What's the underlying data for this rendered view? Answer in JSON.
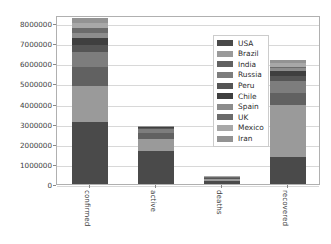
{
  "chart_data": {
    "type": "bar",
    "subtype": "stacked-bar",
    "title": "",
    "xlabel": "",
    "ylabel": "",
    "categories": [
      "confirmed",
      "active",
      "deaths",
      "recovered"
    ],
    "ylim": [
      0,
      8400000
    ],
    "yticks": [
      0,
      1000000,
      2000000,
      3000000,
      4000000,
      5000000,
      6000000,
      7000000,
      8000000
    ],
    "ytick_labels": [
      "0",
      "1000000",
      "2000000",
      "3000000",
      "4000000",
      "5000000",
      "6000000",
      "7000000",
      "8000000"
    ],
    "grid": true,
    "grid_axis": "y",
    "legend": {
      "position": "upper right",
      "inside_axes": true,
      "entries": [
        "USA",
        "Brazil",
        "India",
        "Russia",
        "Peru",
        "Chile",
        "Spain",
        "UK",
        "Mexico",
        "Iran"
      ]
    },
    "series": [
      {
        "name": "USA",
        "color": "#4a4a4a",
        "values": [
          3100000,
          1650000,
          133000,
          1350000
        ]
      },
      {
        "name": "Brazil",
        "color": "#9a9a9a",
        "values": [
          1750000,
          570000,
          97000,
          2580000
        ]
      },
      {
        "name": "India",
        "color": "#616161",
        "values": [
          950000,
          330000,
          24000,
          600000
        ]
      },
      {
        "name": "Russia",
        "color": "#7d7d7d",
        "values": [
          780000,
          175000,
          13000,
          590000
        ]
      },
      {
        "name": "Peru",
        "color": "#555555",
        "values": [
          350000,
          75000,
          13000,
          240000
        ]
      },
      {
        "name": "Chile",
        "color": "#3f3f3f",
        "values": [
          310000,
          16000,
          8000,
          280000
        ]
      },
      {
        "name": "Spain",
        "color": "#8c8c8c",
        "values": [
          280000,
          20000,
          28000,
          150000
        ]
      },
      {
        "name": "UK",
        "color": "#6b6b6b",
        "values": [
          260000,
          14000,
          41000,
          14000
        ]
      },
      {
        "name": "Mexico",
        "color": "#a8a8a8",
        "values": [
          230000,
          12000,
          28000,
          190000
        ]
      },
      {
        "name": "Iran",
        "color": "#939393",
        "values": [
          220000,
          16000,
          13000,
          190000
        ]
      }
    ],
    "totals": [
      8230000,
      2878000,
      398000,
      6184000
    ],
    "bar_width_ratio": 0.55
  },
  "axis": {
    "y_tick_labels": [
      "8000000",
      "7000000",
      "6000000",
      "5000000",
      "4000000",
      "3000000",
      "2000000",
      "1000000",
      "0"
    ],
    "x_tick_labels": [
      "confirmed",
      "active",
      "deaths",
      "recovered"
    ]
  },
  "legend_labels": [
    "USA",
    "Brazil",
    "India",
    "Russia",
    "Peru",
    "Chile",
    "Spain",
    "UK",
    "Mexico",
    "Iran"
  ],
  "colors": {
    "background": "#ffffff",
    "axes_frame": "#b0b0b0",
    "gridline": "#d8d8d8",
    "tick_text": "#3d3d3d"
  }
}
